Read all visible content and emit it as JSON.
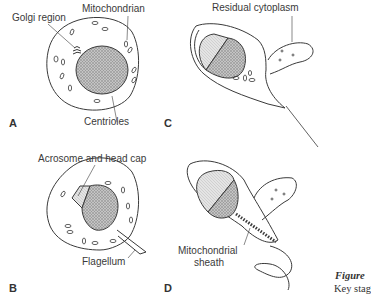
{
  "panels": [
    {
      "id": "A",
      "label": "A",
      "callouts": [
        "Golgi region",
        "Mitochondrian",
        "Centrioles"
      ]
    },
    {
      "id": "B",
      "label": "B",
      "callouts": [
        "Acrosome and head cap",
        "Flagellum"
      ]
    },
    {
      "id": "C",
      "label": "C",
      "callouts": [
        "Residual cytoplasm"
      ]
    },
    {
      "id": "D",
      "label": "D",
      "callouts": [
        "Mitochondrial sheath"
      ]
    }
  ],
  "labels": {
    "golgi": "Golgi region",
    "mitochondrian": "Mitochondrian",
    "centrioles": "Centrioles",
    "acrosome": "Acrosome and head cap",
    "flagellum": "Flagellum",
    "residual": "Residual cytoplasm",
    "mito_sheath_1": "Mitochondrial",
    "mito_sheath_2": "sheath"
  },
  "panel_letters": {
    "a": "A",
    "b": "B",
    "c": "C",
    "d": "D"
  },
  "caption": {
    "figure": "Figure",
    "text": "Key stag"
  },
  "colors": {
    "line": "#3a3a3a",
    "nucleus_fill": "#bdbdbd",
    "acrosome_fill": "#dcdcdc"
  }
}
